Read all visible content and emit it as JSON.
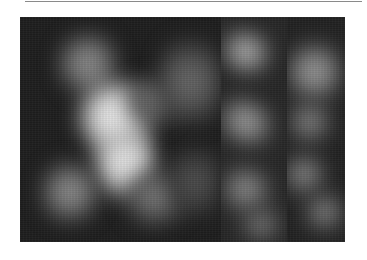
{
  "figure": {
    "panels": [
      {
        "id": "panel-large",
        "content": "bright white X/star-shaped blurred blob"
      },
      {
        "id": "panel-middle",
        "content": "diagonal light streaks"
      },
      {
        "id": "panel-right",
        "content": "diffuse light patches"
      }
    ],
    "colors": {
      "background": "#ffffff",
      "image_dark": "#1c1c1c",
      "highlight": "#f2f2f2",
      "rule": "#8a8a8a"
    }
  }
}
